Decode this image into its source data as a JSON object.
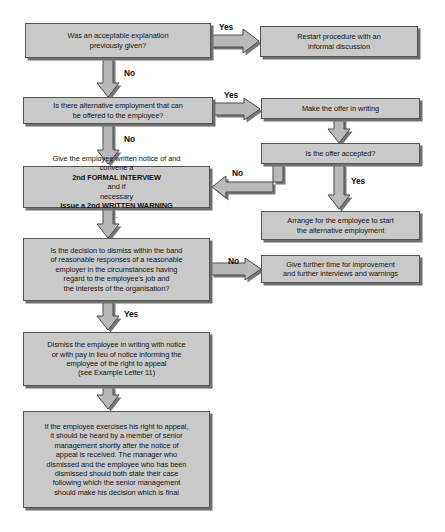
{
  "diagram": {
    "colors": {
      "box_fill": "#c9c9c9",
      "box_border": "#555555",
      "box_shadow": "#6f6f6f",
      "arrow_fill": "#b9b9b9",
      "arrow_border": "#4a4a4a",
      "text": "#141414",
      "background": "#ffffff"
    },
    "nodes": [
      {
        "id": "n1",
        "name": "acceptable-explanation-decision",
        "type": "decision",
        "lines": [
          "Was an acceptable explanation",
          "previously given?"
        ]
      },
      {
        "id": "n2",
        "name": "restart-procedure-box",
        "type": "process",
        "lines": [
          "Restart procedure with an",
          "informal discussion"
        ]
      },
      {
        "id": "n3",
        "name": "alternative-employment-decision",
        "type": "decision",
        "lines": [
          "Is there alternative employment that can",
          "be offered to the employee?"
        ]
      },
      {
        "id": "n4",
        "name": "make-offer-in-writing-box",
        "type": "process",
        "lines": [
          "Make the offer in writing"
        ]
      },
      {
        "id": "n5",
        "name": "offer-accepted-decision",
        "type": "decision",
        "lines": [
          "Is the offer accepted?"
        ]
      },
      {
        "id": "n6",
        "name": "second-formal-interview-box",
        "type": "process",
        "line1": "Give the employee written notice of and",
        "line2_pre": "convene a ",
        "line2_bold": "2nd FORMAL INTERVIEW",
        "line2_post": " and if",
        "line3_pre": "necessary ",
        "line3_bold": "issue a 2nd WRITTEN WARNING",
        "line3_post": "."
      },
      {
        "id": "n7",
        "name": "arrange-alternative-employment-box",
        "type": "process",
        "lines": [
          "Arrange for the employee to start",
          "the alternative employment"
        ]
      },
      {
        "id": "n8",
        "name": "band-of-reasonable-responses-decision",
        "type": "decision",
        "lines": [
          "Is the decision to dismiss within the band",
          "of reasonable responses of a reasonable",
          "employer in the circumstances having",
          "regard to the employee's job and",
          "the interests of the organisation?"
        ]
      },
      {
        "id": "n9",
        "name": "give-further-time-box",
        "type": "process",
        "lines": [
          "Give further time for improvement",
          "and further interviews and warnings"
        ]
      },
      {
        "id": "n10",
        "name": "dismiss-employee-box",
        "type": "process",
        "lines": [
          "Dismiss the employee in writing with notice",
          "or with pay in lieu of notice informing the",
          "employee of the right to appeal",
          "(see Example Letter 11)"
        ]
      },
      {
        "id": "n11",
        "name": "appeal-process-box",
        "type": "process",
        "lines": [
          "If the employee exercises his right to appeal,",
          "it should be heard by a member of senior",
          "management shortly after the notice of",
          "appeal is received. The manager who",
          "dismissed and the employee who has been",
          "dismissed should both state their case",
          "following which the senior management",
          "should make his decision which is final"
        ]
      }
    ],
    "edge_labels": [
      {
        "id": "e1",
        "name": "yes-label-explanation",
        "text": "Yes"
      },
      {
        "id": "e2",
        "name": "no-label-explanation",
        "text": "No"
      },
      {
        "id": "e3",
        "name": "yes-label-alternative-employment",
        "text": "Yes"
      },
      {
        "id": "e4",
        "name": "no-label-alternative-employment",
        "text": "No"
      },
      {
        "id": "e5",
        "name": "no-label-offer-accepted",
        "text": "No"
      },
      {
        "id": "e6",
        "name": "yes-label-offer-accepted",
        "text": "Yes"
      },
      {
        "id": "e7",
        "name": "no-label-reasonable-responses",
        "text": "No"
      },
      {
        "id": "e8",
        "name": "yes-label-reasonable-responses",
        "text": "Yes"
      }
    ]
  }
}
